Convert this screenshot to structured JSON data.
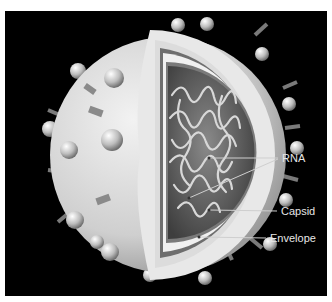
{
  "diagram": {
    "background": "#000000",
    "labels": [
      {
        "id": "rna",
        "text": "RNA"
      },
      {
        "id": "capsid",
        "text": "Capsid"
      },
      {
        "id": "envelope",
        "text": "Envelope"
      }
    ]
  }
}
